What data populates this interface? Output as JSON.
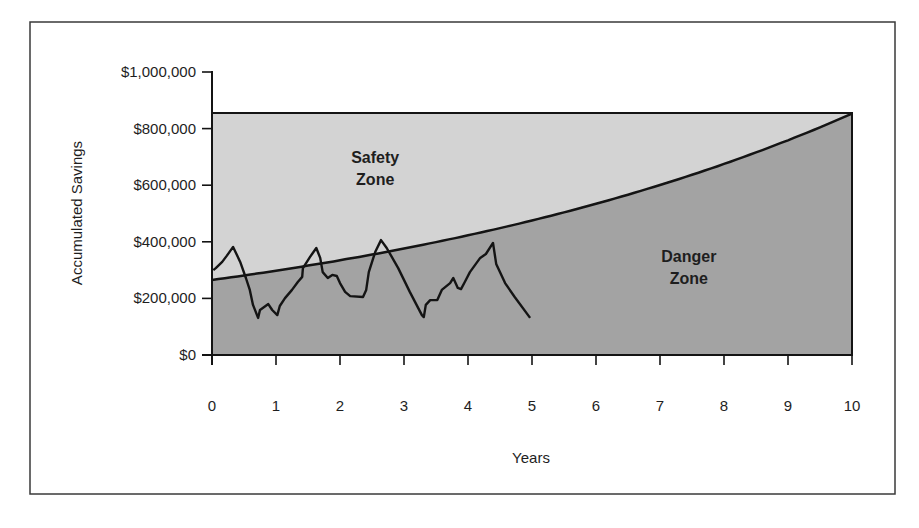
{
  "chart_data": {
    "type": "area",
    "title": "",
    "xlabel": "Years",
    "ylabel": "Accumulated Savings",
    "xlim": [
      0,
      10
    ],
    "ylim": [
      0,
      1000000
    ],
    "x_ticks": [
      0,
      1,
      2,
      3,
      4,
      5,
      6,
      7,
      8,
      9,
      10
    ],
    "x_tick_labels": [
      "0",
      "1",
      "2",
      "3",
      "4",
      "5",
      "6",
      "7",
      "8",
      "9",
      "10"
    ],
    "y_ticks": [
      0,
      200000,
      400000,
      600000,
      800000,
      1000000
    ],
    "y_tick_labels": [
      "$0",
      "$200,000",
      "$400,000",
      "$600,000",
      "$800,000",
      "$1,000,000"
    ],
    "grid": false,
    "legend": null,
    "annotations": [
      {
        "text_lines": [
          "Safety",
          "Zone"
        ],
        "x": 2.55,
        "y": 680000
      },
      {
        "text_lines": [
          "Danger",
          "Zone"
        ],
        "x": 7.45,
        "y": 330000
      }
    ],
    "zones": {
      "safety": {
        "label": "Safety Zone",
        "color": "#d2d2d2",
        "upper_bound": 855000
      },
      "danger": {
        "label": "Danger Zone",
        "color": "#a4a4a4"
      }
    },
    "series": [
      {
        "name": "Target savings curve",
        "kind": "exponential-boundary",
        "start_value": 265000,
        "growth_rate": 0.124,
        "x": [
          0,
          1,
          2,
          3,
          4,
          5,
          6,
          7,
          8,
          9,
          10
        ],
        "values": [
          265000,
          298000,
          335000,
          376000,
          423000,
          475000,
          534000,
          601000,
          675000,
          759000,
          855000
        ]
      },
      {
        "name": "Actual savings",
        "kind": "line",
        "x": [
          0.02,
          0.06,
          0.16,
          0.23,
          0.33,
          0.44,
          0.53,
          0.59,
          0.64,
          0.72,
          0.75,
          0.88,
          0.94,
          1.02,
          1.06,
          1.14,
          1.25,
          1.34,
          1.41,
          1.42,
          1.53,
          1.63,
          1.69,
          1.73,
          1.81,
          1.88,
          1.95,
          2.0,
          2.08,
          2.16,
          2.36,
          2.41,
          2.45,
          2.55,
          2.64,
          2.73,
          2.91,
          3.09,
          3.28,
          3.31,
          3.34,
          3.41,
          3.52,
          3.59,
          3.72,
          3.77,
          3.84,
          3.89,
          3.95,
          4.03,
          4.19,
          4.28,
          4.39,
          4.44,
          4.58,
          4.73,
          4.97
        ],
        "values": [
          300000,
          307000,
          329000,
          350000,
          382000,
          329000,
          272000,
          230000,
          177000,
          131000,
          159000,
          180000,
          159000,
          141000,
          173000,
          201000,
          230000,
          258000,
          276000,
          307000,
          346000,
          378000,
          343000,
          293000,
          272000,
          283000,
          279000,
          254000,
          223000,
          208000,
          205000,
          230000,
          293000,
          364000,
          406000,
          378000,
          307000,
          223000,
          141000,
          134000,
          177000,
          194000,
          194000,
          230000,
          254000,
          272000,
          237000,
          233000,
          258000,
          293000,
          343000,
          357000,
          396000,
          322000,
          254000,
          205000,
          131000
        ]
      }
    ]
  },
  "colors": {
    "safety_zone": "#d3d3d3",
    "danger_zone": "#a3a3a3",
    "line": "#141414",
    "frame": "#3a3a3a",
    "background": "#ffffff"
  }
}
